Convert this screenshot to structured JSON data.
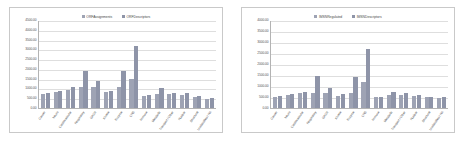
{
  "figure": {
    "panel_count": 2,
    "background": "#ffffff",
    "border_color": "#c9c9c9"
  },
  "colors": {
    "series1": "#9ea3b4",
    "series2": "#8e94a8",
    "gridline": "#dedede",
    "axis": "#b3b3b3",
    "text": "#4d4d4d"
  },
  "chart_data": [
    {
      "type": "bar",
      "panel": "left",
      "title": "",
      "xlabel": "",
      "ylabel": "",
      "ylim": [
        0,
        4500
      ],
      "ytick_step": 500,
      "grid": true,
      "legend_position": "top-center",
      "ticks": [
        "0.00",
        "500.00",
        "1000.00",
        "1500.00",
        "2000.00",
        "2500.00",
        "3000.00",
        "3500.00",
        "4000.00",
        "4500.00"
      ],
      "categories": [
        "Cancer",
        "Neuro",
        "Cardiovascular",
        "Respiratory",
        "GPCR",
        "Kinase",
        "Enzyme",
        "CNS",
        "Immune",
        "Metabolic",
        "Transport / Other",
        "Nuclear",
        "Structural",
        "Unclassified / NA"
      ],
      "series": [
        {
          "name": "ORFAssignments",
          "values": [
            700,
            820,
            940,
            1100,
            1050,
            800,
            1050,
            1500,
            620,
            700,
            700,
            680,
            540,
            480
          ]
        },
        {
          "name": "ORFDescriptors",
          "values": [
            760,
            880,
            1060,
            1900,
            1380,
            880,
            1900,
            3150,
            690,
            1000,
            780,
            770,
            600,
            500
          ]
        }
      ]
    },
    {
      "type": "bar",
      "panel": "right",
      "title": "",
      "xlabel": "",
      "ylabel": "",
      "ylim": [
        0,
        4000
      ],
      "ytick_step": 500,
      "grid": true,
      "legend_position": "top-center",
      "ticks": [
        "0.00",
        "500.00",
        "1000.00",
        "1500.00",
        "2000.00",
        "2500.00",
        "3000.00",
        "3500.00",
        "4000.00"
      ],
      "categories": [
        "Cancer",
        "Neuro",
        "Cardiovascular",
        "Respiratory",
        "GPCR",
        "Kinase",
        "Enzyme",
        "CNS",
        "Immune",
        "Metabolic",
        "Transport / Other",
        "Nuclear",
        "Structural",
        "Unclassified / NA"
      ],
      "series": [
        {
          "name": "IMSNRegulated",
          "values": [
            520,
            600,
            660,
            700,
            700,
            560,
            700,
            1200,
            500,
            580,
            600,
            540,
            480,
            460
          ]
        },
        {
          "name": "IMSNDescriptors",
          "values": [
            540,
            640,
            720,
            1450,
            900,
            620,
            1420,
            2700,
            520,
            740,
            700,
            600,
            520,
            500
          ]
        }
      ]
    }
  ]
}
